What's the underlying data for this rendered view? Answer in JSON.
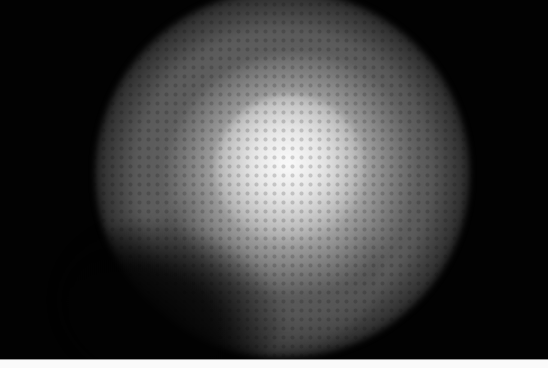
{
  "image": {
    "subject": "diffuse bright grayscale blob on black background",
    "colors": {
      "background": "#020202",
      "halo": "#787878",
      "core": "#fafafa",
      "bottom_strip": "#fafafa"
    }
  }
}
